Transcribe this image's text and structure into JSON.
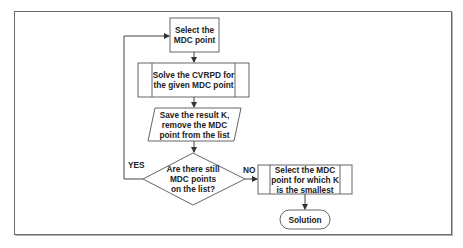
{
  "diagram": {
    "type": "flowchart",
    "colors": {
      "stroke": "#555555",
      "text": "#222222",
      "background": "#ffffff",
      "frame": "#6a6a6a"
    },
    "nodes": [
      {
        "id": "select_mdc",
        "shape": "rectangle",
        "label": "Select the\nMDC point"
      },
      {
        "id": "solve_cvrpd",
        "shape": "predefined-process",
        "label": "Solve the CVRPD for\nthe given MDC point"
      },
      {
        "id": "save_result",
        "shape": "parallelogram",
        "label": "Save the result K,\nremove the MDC\npoint from the list"
      },
      {
        "id": "decision",
        "shape": "diamond",
        "label": "Are there still\nMDC points\non the list?"
      },
      {
        "id": "select_smallest",
        "shape": "predefined-process",
        "label": "Select the MDC\npoint for which K\nis the smallest"
      },
      {
        "id": "solution",
        "shape": "terminator",
        "label": "Solution"
      }
    ],
    "edges": [
      {
        "from": "select_mdc",
        "to": "solve_cvrpd",
        "label": ""
      },
      {
        "from": "solve_cvrpd",
        "to": "save_result",
        "label": ""
      },
      {
        "from": "save_result",
        "to": "decision",
        "label": ""
      },
      {
        "from": "decision",
        "to": "select_mdc",
        "label": "YES"
      },
      {
        "from": "decision",
        "to": "select_smallest",
        "label": "NO"
      },
      {
        "from": "select_smallest",
        "to": "solution",
        "label": ""
      }
    ],
    "edge_labels": {
      "yes": "YES",
      "no": "NO"
    }
  }
}
